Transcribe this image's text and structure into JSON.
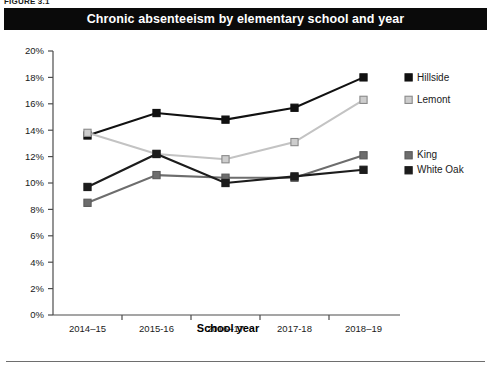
{
  "figure": {
    "number_label": "FIGURE 3.1",
    "title": "Chronic absenteeism by elementary school and year"
  },
  "chart_data": {
    "type": "line",
    "title": "Chronic absenteeism by elementary school and year",
    "xlabel": "School year",
    "ylabel": "",
    "categories": [
      "2014–15",
      "2015-16",
      "2016–17",
      "2017-18",
      "2018–19"
    ],
    "ylim": [
      0,
      20
    ],
    "ytick_labels": [
      "0%",
      "2%",
      "4%",
      "6%",
      "8%",
      "10%",
      "12%",
      "14%",
      "16%",
      "18%",
      "20%"
    ],
    "ytick_values": [
      0,
      2,
      4,
      6,
      8,
      10,
      12,
      14,
      16,
      18,
      20
    ],
    "grid": false,
    "legend_position": "right",
    "series": [
      {
        "name": "Hillside",
        "color": "#111111",
        "marker_fill": "#111111",
        "marker_stroke": "#111111",
        "values": [
          13.6,
          15.3,
          14.8,
          15.7,
          18.0
        ]
      },
      {
        "name": "Lemont",
        "color": "#c3c3c3",
        "marker_fill": "#cdcdcd",
        "marker_stroke": "#8a8a8a",
        "values": [
          13.8,
          12.2,
          11.8,
          13.1,
          16.3
        ]
      },
      {
        "name": "King",
        "color": "#6d6d6d",
        "marker_fill": "#6d6d6d",
        "marker_stroke": "#5a5a5a",
        "values": [
          8.5,
          10.6,
          10.4,
          10.4,
          12.1
        ]
      },
      {
        "name": "White Oak",
        "color": "#1c1c1c",
        "marker_fill": "#1c1c1c",
        "marker_stroke": "#1c1c1c",
        "values": [
          9.7,
          12.2,
          10.0,
          10.5,
          11.0
        ]
      }
    ]
  }
}
